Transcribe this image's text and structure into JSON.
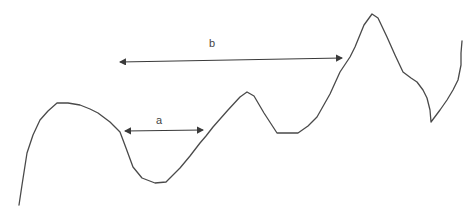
{
  "diagram": {
    "type": "hand-drawn wave curve with distance annotations",
    "stroke_color": "#4a4a4a",
    "background": "#ffffff",
    "curve": {
      "points": "19,205 22,185 27,153 33,135 40,120 48,111 57,103 68,103 80,105 90,109 98,113 110,122 120,132 126,148 133,167 142,178 155,183 166,182 180,168 190,156 200,143 206,136 213,127 228,110 240,97 247,92 254,96 264,113 277,133 288,133 298,133 308,126 317,117 330,94 340,72 350,57 355,47 364,25 372,14 378,18 387,37 395,55 403,72 411,78 417,82 423,90 427,98 430,110 431,122 440,110 447,100 453,90 458,80 461,65 461,53 462,41"
    },
    "arrows": [
      {
        "id": "a",
        "label": "a",
        "x1": 125,
        "y1": 131,
        "x2": 203,
        "y2": 130,
        "label_x": 156,
        "label_y": 115
      },
      {
        "id": "b",
        "label": "b",
        "x1": 120,
        "y1": 62,
        "x2": 342,
        "y2": 58,
        "label_x": 209,
        "label_y": 38
      }
    ]
  }
}
